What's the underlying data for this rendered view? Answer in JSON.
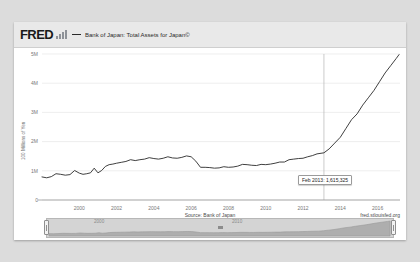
{
  "brand": {
    "logo_text": "FRED",
    "logo_mark_name": "bar-chart-mark"
  },
  "header": {
    "series_label": "Bank of Japan: Total Assets for Japan©"
  },
  "tooltip": {
    "text": "Feb 2013: 1,615,325",
    "date": "Feb 2013",
    "value": 1615325
  },
  "footer": {
    "source": "Source: Bank of Japan",
    "url": "fred.stlouisfed.org"
  },
  "navigator": {
    "left_year": "2000",
    "right_year": "2010",
    "handle_left_name": "range-handle-left",
    "handle_right_name": "range-handle-right"
  },
  "chart_data": {
    "type": "line",
    "title": "Bank of Japan: Total Assets for Japan©",
    "xlabel": "",
    "ylabel": "100 Millions of Yen",
    "ylim": [
      0,
      5000000
    ],
    "xlim": [
      1998.0,
      2017.2
    ],
    "grid": true,
    "legend_position": "top",
    "annotation": "Feb 2013: 1,615,325",
    "yticks": [
      0,
      1000000,
      2000000,
      3000000,
      4000000,
      5000000
    ],
    "ytick_labels": [
      "0",
      "1M",
      "2M",
      "3M",
      "4M",
      "5M"
    ],
    "xticks": [
      2000,
      2002,
      2004,
      2006,
      2008,
      2010,
      2012,
      2014,
      2016
    ],
    "xtick_labels": [
      "2000",
      "2002",
      "2004",
      "2006",
      "2008",
      "2010",
      "2012",
      "2014",
      "2016"
    ],
    "series": [
      {
        "name": "Bank of Japan: Total Assets for Japan©",
        "color": "#2a2a2a",
        "x": [
          1998.0,
          1998.25,
          1998.5,
          1998.75,
          1999.0,
          1999.25,
          1999.5,
          1999.75,
          2000.0,
          2000.2,
          2000.4,
          2000.6,
          2000.8,
          2001.0,
          2001.2,
          2001.4,
          2001.6,
          2001.8,
          2002.0,
          2002.25,
          2002.5,
          2002.75,
          2003.0,
          2003.25,
          2003.5,
          2003.75,
          2004.0,
          2004.25,
          2004.5,
          2004.75,
          2005.0,
          2005.25,
          2005.5,
          2005.75,
          2006.0,
          2006.25,
          2006.5,
          2006.75,
          2007.0,
          2007.25,
          2007.5,
          2007.75,
          2008.0,
          2008.25,
          2008.5,
          2008.75,
          2009.0,
          2009.25,
          2009.5,
          2009.75,
          2010.0,
          2010.25,
          2010.5,
          2010.75,
          2011.0,
          2011.25,
          2011.5,
          2011.75,
          2012.0,
          2012.25,
          2012.5,
          2012.75,
          2013.12,
          2013.4,
          2013.7,
          2014.0,
          2014.3,
          2014.6,
          2014.9,
          2015.2,
          2015.5,
          2015.8,
          2016.1,
          2016.4,
          2016.7,
          2017.0,
          2017.15
        ],
        "y": [
          790000,
          760000,
          800000,
          900000,
          880000,
          850000,
          870000,
          1010000,
          920000,
          880000,
          900000,
          930000,
          1090000,
          930000,
          1010000,
          1150000,
          1210000,
          1230000,
          1260000,
          1290000,
          1320000,
          1380000,
          1350000,
          1380000,
          1400000,
          1450000,
          1420000,
          1400000,
          1430000,
          1480000,
          1440000,
          1430000,
          1460000,
          1510000,
          1480000,
          1330000,
          1120000,
          1120000,
          1110000,
          1090000,
          1100000,
          1140000,
          1120000,
          1130000,
          1160000,
          1220000,
          1210000,
          1190000,
          1180000,
          1220000,
          1210000,
          1230000,
          1260000,
          1300000,
          1300000,
          1380000,
          1400000,
          1420000,
          1430000,
          1480000,
          1520000,
          1580000,
          1615325,
          1750000,
          1950000,
          2150000,
          2450000,
          2750000,
          2950000,
          3250000,
          3500000,
          3750000,
          4050000,
          4350000,
          4600000,
          4850000,
          4980000
        ]
      }
    ]
  }
}
